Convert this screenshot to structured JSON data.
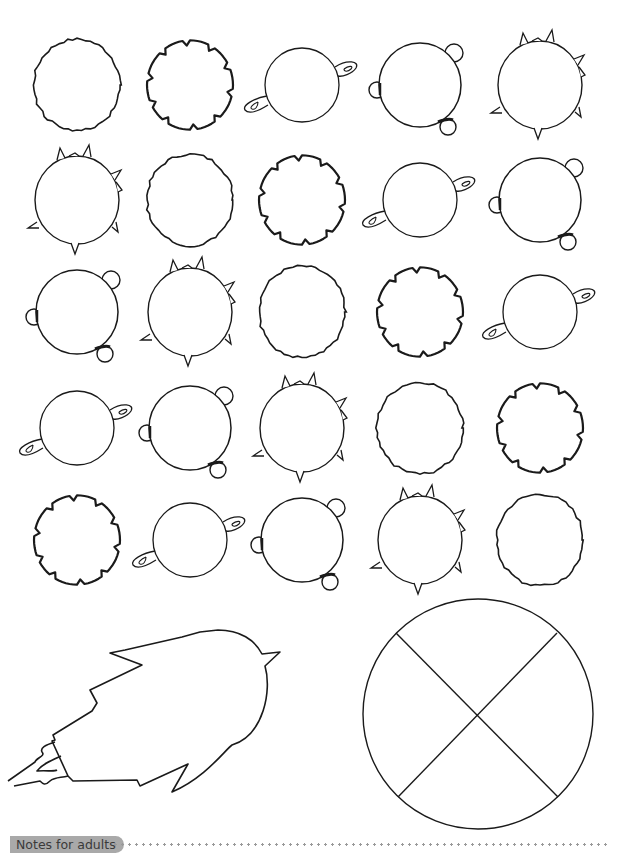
{
  "grid": {
    "rows": 5,
    "columns": 5,
    "shape_types": {
      "A": "wobbly-planet",
      "B": "notched-planet",
      "C": "ringed-planet",
      "D": "planet-with-moons",
      "E": "spiky-planet"
    },
    "layout": [
      [
        "A",
        "B",
        "C",
        "D",
        "E"
      ],
      [
        "E",
        "A",
        "B",
        "C",
        "D"
      ],
      [
        "D",
        "E",
        "A",
        "B",
        "C"
      ],
      [
        "C",
        "D",
        "E",
        "A",
        "B"
      ],
      [
        "B",
        "C",
        "D",
        "E",
        "A"
      ]
    ]
  },
  "bottom_figures": {
    "left": "rocket-outline",
    "right": "circle-divided-in-four"
  },
  "footer": {
    "notes_label": "Notes for adults"
  },
  "colors": {
    "stroke": "#1a1a1a",
    "pill": "#a9a9a9",
    "dots": "#999999"
  }
}
